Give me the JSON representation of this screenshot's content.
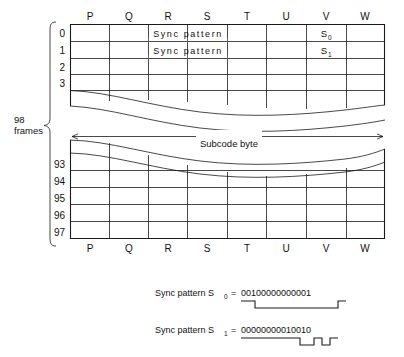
{
  "diagram": {
    "title_hidden": "CD subcode frame structure",
    "frames_label_line1": "98",
    "frames_label_line2": "frames",
    "subcode_arrow_label": "Subcode byte",
    "columns": [
      "P",
      "Q",
      "R",
      "S",
      "T",
      "U",
      "V",
      "W"
    ],
    "upper_table": {
      "row_labels": [
        "0",
        "1",
        "2",
        "3"
      ],
      "sync_cell_text": "Sync pattern",
      "sync_rows": [
        "0",
        "1"
      ],
      "sync_span_columns": [
        "Q",
        "R",
        "S",
        "T"
      ],
      "marker_column": "V",
      "row0_marker_base": "S",
      "row0_marker_sub": "0",
      "row1_marker_base": "S",
      "row1_marker_sub": "1"
    },
    "lower_table": {
      "row_labels": [
        "93",
        "94",
        "95",
        "96",
        "97"
      ]
    },
    "sync_patterns": [
      {
        "label_prefix": "Sync pattern S",
        "label_sub": "0",
        "equals": "=",
        "bits": "00100000000001"
      },
      {
        "label_prefix": "Sync pattern S",
        "label_sub": "1",
        "equals": "=",
        "bits": "00000000010010"
      }
    ],
    "colors": {
      "ink": "#1a1a1a",
      "paper": "#ffffff",
      "faint_rule": "#777777"
    }
  }
}
